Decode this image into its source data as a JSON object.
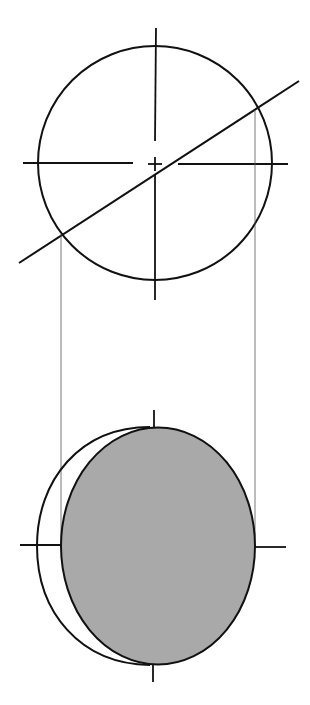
{
  "diagram": {
    "title": "",
    "colors": {
      "background": "#ffffff",
      "stroke": "#111111",
      "projection_line": "#555555",
      "section_fill": "#a9a9a9"
    },
    "top_view": {
      "circle": {
        "cx": 155,
        "cy": 163,
        "r": 117
      },
      "vertical_axis": {
        "x": 155,
        "y1": 28,
        "y2": 300,
        "gap": [
          141,
          153
        ]
      },
      "horizontal_axis": {
        "y": 163,
        "x1": 23,
        "x2": 288,
        "gap_left": 133,
        "gap_right": 178
      },
      "center_mark": {
        "x": 155,
        "y": 163,
        "size": 7
      },
      "cutting_line": {
        "x1": 19,
        "y1": 263,
        "x2": 299,
        "y2": 81
      },
      "intersections": [
        {
          "x": 62,
          "y": 234
        },
        {
          "x": 256,
          "y": 108
        }
      ]
    },
    "projection_lines": [
      {
        "x": 61,
        "y1": 234,
        "y2": 548
      },
      {
        "x": 255,
        "y1": 108,
        "y2": 548
      }
    ],
    "bottom_view": {
      "outer_circle": {
        "cx": 155,
        "cy": 545,
        "r": 118
      },
      "section_ellipse": {
        "cx": 158,
        "cy": 546,
        "rx": 97,
        "ry": 118
      },
      "vertical_ticks": [
        {
          "x": 154,
          "y1": 410,
          "y2": 428
        },
        {
          "x": 153,
          "y1": 664,
          "y2": 682
        }
      ],
      "horizontal_ticks": [
        {
          "y": 545,
          "x1": 20,
          "x2": 60
        },
        {
          "y": 547,
          "x1": 255,
          "x2": 286
        }
      ]
    }
  }
}
